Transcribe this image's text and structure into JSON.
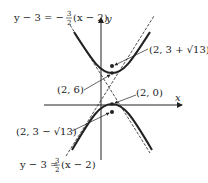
{
  "diagram": {
    "type": "hyperbola-graph",
    "axes": {
      "x_label": "x",
      "y_label": "y"
    },
    "center": "(2, 3)",
    "labels": {
      "upper_asymptote_eq": "y − 3 = −",
      "upper_asymptote_frac_num": "3",
      "upper_asymptote_frac_den": "2",
      "upper_asymptote_tail": "(x − 2)",
      "lower_asymptote_eq": "y − 3 =",
      "lower_asymptote_frac_num": "3",
      "lower_asymptote_frac_den": "2",
      "lower_asymptote_tail": "(x − 2)",
      "upper_vertex": "(2, 6)",
      "lower_vertex": "(2, 0)",
      "upper_focus": "(2, 3 + √13)",
      "lower_focus": "(2, 3 − √13)"
    },
    "colors": {
      "ink": "#222222",
      "background": "#ffffff"
    }
  }
}
